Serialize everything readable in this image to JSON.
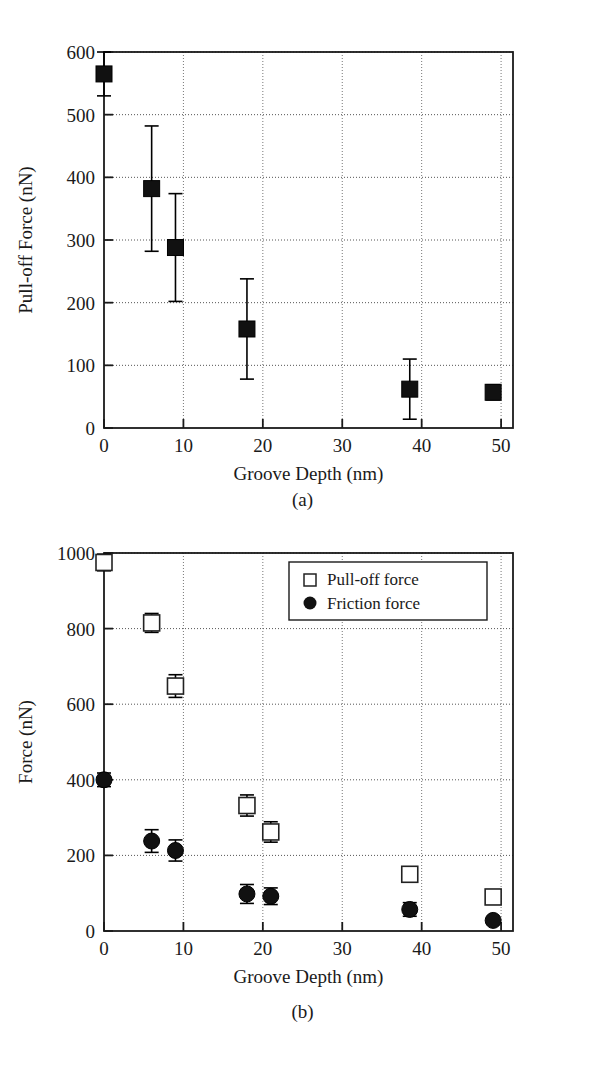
{
  "figure": {
    "caption_a": "(a)",
    "caption_b": "(b)"
  },
  "panel_a": {
    "xlabel": "Groove Depth (nm)",
    "ylabel": "Pull-off Force (nN)",
    "xticks": [
      "0",
      "10",
      "20",
      "30",
      "40",
      "50"
    ],
    "yticks": [
      "0",
      "100",
      "200",
      "300",
      "400",
      "500",
      "600"
    ]
  },
  "panel_b": {
    "xlabel": "Groove Depth (nm)",
    "ylabel": "Force (nN)",
    "xticks": [
      "0",
      "10",
      "20",
      "30",
      "40",
      "50"
    ],
    "yticks": [
      "0",
      "200",
      "400",
      "600",
      "800",
      "1000"
    ],
    "legend": {
      "item_1": "Pull-off force",
      "item_2": "Friction force"
    }
  },
  "chart_data": [
    {
      "type": "scatter",
      "panel": "(a)",
      "title": "",
      "xlabel": "Groove Depth (nm)",
      "ylabel": "Pull-off Force (nN)",
      "xlim": [
        0,
        51.5
      ],
      "ylim": [
        0,
        600
      ],
      "xticks": [
        0,
        10,
        20,
        30,
        40,
        50
      ],
      "yticks": [
        0,
        100,
        200,
        300,
        400,
        500,
        600
      ],
      "grid": true,
      "legend": "none",
      "marker": "filled-square",
      "series": [
        {
          "name": "Pull-off force",
          "marker": "filled-square",
          "color": "#000000",
          "x": [
            0,
            6,
            9,
            18,
            38.5,
            49
          ],
          "y": [
            565,
            382,
            288,
            158,
            62,
            57
          ],
          "yerr": [
            35,
            100,
            86,
            80,
            48,
            12
          ]
        }
      ]
    },
    {
      "type": "scatter",
      "panel": "(b)",
      "title": "",
      "xlabel": "Groove Depth (nm)",
      "ylabel": "Force (nN)",
      "xlim": [
        0,
        51.5
      ],
      "ylim": [
        0,
        1000
      ],
      "xticks": [
        0,
        10,
        20,
        30,
        40,
        50
      ],
      "yticks": [
        0,
        200,
        400,
        600,
        800,
        1000
      ],
      "grid": true,
      "legend": "upper right",
      "series": [
        {
          "name": "Pull-off force",
          "marker": "open-square",
          "color": "#000000",
          "x": [
            0,
            6,
            9,
            18,
            21,
            38.5,
            49
          ],
          "y": [
            975,
            815,
            648,
            332,
            262,
            150,
            90
          ],
          "yerr": [
            22,
            25,
            30,
            28,
            27,
            0,
            0
          ]
        },
        {
          "name": "Friction force",
          "marker": "filled-circle",
          "color": "#000000",
          "x": [
            0,
            6,
            9,
            18,
            21,
            38.5,
            49
          ],
          "y": [
            400,
            238,
            213,
            98,
            92,
            57,
            28
          ],
          "yerr": [
            18,
            30,
            28,
            25,
            22,
            18,
            0
          ]
        }
      ]
    }
  ]
}
